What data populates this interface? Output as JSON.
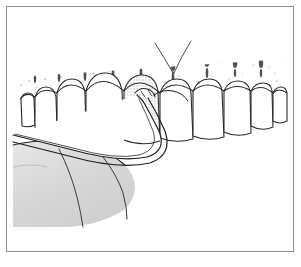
{
  "document": {
    "type": "illustration",
    "domain": "dental-anatomy",
    "title": "",
    "caption": "",
    "background_color": "#ffffff",
    "frame": {
      "visible": true,
      "border_color": "#8e9296",
      "border_width_px": 1,
      "inset_px": 6
    }
  },
  "illustration": {
    "name": "periodontal-instrumentation-diagram",
    "description": "Line drawing of a maxillary anterior dental arch in facial view with stippled attached gingiva, a shaded highlighted tooth, and a curved periodontal instrument inserted into the gingival sulcus; a retracted lip is shaded at lower left.",
    "line_color": "#2a2a2a",
    "stipple_color": "#4a4a4a",
    "shade_tooth_color": "#d9d9d9",
    "shade_lip_color": "#dcdcdc",
    "tooth_fill_color": "#ffffff",
    "parts": [
      {
        "id": "attached-gingiva",
        "label": "Attached gingiva (stippled)",
        "region": "upper band above teeth",
        "texture": "stipple"
      },
      {
        "id": "frenum",
        "label": "Labial frenum",
        "region": "upper center",
        "shape": "V-shaped line"
      },
      {
        "id": "root-eminences",
        "label": "Root eminences",
        "count": 9,
        "region": "vertical dark streaks within stippled gingiva"
      },
      {
        "id": "dental-arch",
        "label": "Maxillary dental arch",
        "tooth_count": 10,
        "region": "center band"
      },
      {
        "id": "highlighted-tooth",
        "label": "Treated tooth (shaded)",
        "index": 4,
        "fill": "#d9d9d9"
      },
      {
        "id": "instrument",
        "label": "Curved periodontal instrument",
        "parts": [
          "shank",
          "curved working end",
          "tip in sulcus"
        ],
        "entry": "from lower left"
      },
      {
        "id": "retracted-lip",
        "label": "Retracted lip / cheek",
        "region": "lower left",
        "fill": "#dcdcdc"
      }
    ],
    "teeth": [
      {
        "index": 0,
        "label": "Tooth 1",
        "crown_height": 32,
        "shaded": false
      },
      {
        "index": 1,
        "label": "Tooth 2",
        "crown_height": 40,
        "shaded": false
      },
      {
        "index": 2,
        "label": "Tooth 3",
        "crown_height": 48,
        "shaded": false
      },
      {
        "index": 3,
        "label": "Tooth 4",
        "crown_height": 52,
        "shaded": false
      },
      {
        "index": 4,
        "label": "Tooth 5 (treated)",
        "crown_height": 50,
        "shaded": true
      },
      {
        "index": 5,
        "label": "Tooth 6",
        "crown_height": 46,
        "shaded": false
      },
      {
        "index": 6,
        "label": "Tooth 7",
        "crown_height": 44,
        "shaded": false
      },
      {
        "index": 7,
        "label": "Tooth 8",
        "crown_height": 40,
        "shaded": false
      },
      {
        "index": 8,
        "label": "Tooth 9",
        "crown_height": 34,
        "shaded": false
      },
      {
        "index": 9,
        "label": "Tooth 10",
        "crown_height": 28,
        "shaded": false
      }
    ]
  }
}
